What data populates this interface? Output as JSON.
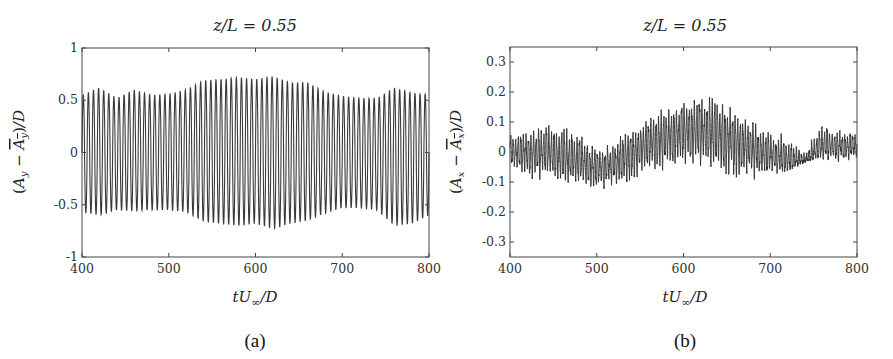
{
  "panels": [
    {
      "id": "a",
      "title": "z/L = 0.55",
      "caption": "(a)",
      "xlabel": "tU∞/D",
      "ylabel": "(Ay − Āy)/D"
    },
    {
      "id": "b",
      "title": "z/L = 0.55",
      "caption": "(b)",
      "xlabel": "tU∞/D",
      "ylabel": "(Ax − Āx)/D"
    }
  ],
  "chart_data": [
    {
      "type": "line",
      "panel": "a",
      "title": "z/L = 0.55",
      "xlabel": "tU∞/D",
      "ylabel": "(A_y − mean(A_y))/D",
      "xlim": [
        400,
        800
      ],
      "ylim": [
        -1,
        1
      ],
      "xticks": [
        400,
        500,
        600,
        700,
        800
      ],
      "yticks": [
        -1,
        -0.5,
        0,
        0.5,
        1
      ],
      "ytick_labels": [
        "-1",
        "-0.5",
        "0",
        "0.5",
        "1"
      ],
      "grid": false,
      "legend": null,
      "cycles": 68,
      "series": [
        {
          "name": "cross-flow displacement",
          "color": "#3a3a3a",
          "description": "Nearly sinusoidal oscillation, ~68 cycles over 400–800, amplitude modulated between ~0.5 and ~0.72",
          "envelope": {
            "x": [
              400,
              420,
              440,
              460,
              480,
              500,
              520,
              540,
              560,
              580,
              600,
              620,
              640,
              660,
              680,
              700,
              720,
              740,
              760,
              780,
              800
            ],
            "upper": [
              0.55,
              0.62,
              0.52,
              0.6,
              0.55,
              0.56,
              0.6,
              0.69,
              0.7,
              0.72,
              0.7,
              0.73,
              0.67,
              0.67,
              0.58,
              0.54,
              0.52,
              0.52,
              0.62,
              0.57,
              0.56
            ],
            "lower": [
              -0.57,
              -0.6,
              -0.55,
              -0.56,
              -0.55,
              -0.55,
              -0.57,
              -0.66,
              -0.68,
              -0.7,
              -0.68,
              -0.73,
              -0.68,
              -0.65,
              -0.58,
              -0.53,
              -0.53,
              -0.55,
              -0.7,
              -0.68,
              -0.6
            ]
          }
        }
      ]
    },
    {
      "type": "line",
      "panel": "b",
      "title": "z/L = 0.55",
      "xlabel": "tU∞/D",
      "ylabel": "(A_x − mean(A_x))/D",
      "xlim": [
        400,
        800
      ],
      "ylim": [
        -0.35,
        0.35
      ],
      "xticks": [
        400,
        500,
        600,
        700,
        800
      ],
      "yticks": [
        -0.3,
        -0.2,
        -0.1,
        0,
        0.1,
        0.2,
        0.3
      ],
      "ytick_labels": [
        "-0.3",
        "-0.2",
        "-0.1",
        "0",
        "0.1",
        "0.2",
        "0.3"
      ],
      "grid": false,
      "legend": null,
      "cycles": 136,
      "series": [
        {
          "name": "in-line displacement",
          "color": "#2e2e2e",
          "description": "Noisy oscillation at ~2x the cross-flow frequency; slow drift with a hump peaking near tU/D≈610",
          "envelope": {
            "x": [
              400,
              420,
              440,
              460,
              480,
              500,
              520,
              540,
              560,
              580,
              600,
              620,
              640,
              660,
              680,
              700,
              720,
              740,
              760,
              780,
              800
            ],
            "mean": [
              0.0,
              0.0,
              0.0,
              -0.02,
              -0.03,
              -0.05,
              -0.04,
              0.0,
              0.03,
              0.05,
              0.07,
              0.07,
              0.06,
              0.04,
              0.01,
              -0.01,
              -0.03,
              -0.03,
              0.02,
              0.02,
              0.02
            ],
            "upper": [
              0.07,
              0.07,
              0.1,
              0.09,
              0.07,
              0.01,
              0.03,
              0.09,
              0.12,
              0.15,
              0.17,
              0.19,
              0.18,
              0.13,
              0.11,
              0.08,
              0.05,
              0.0,
              0.11,
              0.07,
              0.06
            ],
            "lower": [
              -0.06,
              -0.09,
              -0.1,
              -0.1,
              -0.12,
              -0.13,
              -0.12,
              -0.1,
              -0.07,
              -0.06,
              -0.04,
              -0.05,
              -0.06,
              -0.1,
              -0.09,
              -0.08,
              -0.08,
              -0.03,
              -0.03,
              -0.03,
              -0.03
            ]
          }
        }
      ]
    }
  ]
}
